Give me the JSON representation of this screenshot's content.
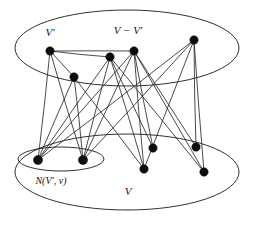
{
  "figure": {
    "background_color": "#ffffff",
    "stroke_color": "#1a1a1a",
    "node_color": "#0d0d0d",
    "width": 253,
    "height": 228
  },
  "labels": [
    {
      "id": "v-prime",
      "text": "V′",
      "x": 50,
      "y": 33,
      "size": "normal"
    },
    {
      "id": "v-minus-vprime",
      "text": "V − V′",
      "x": 128,
      "y": 31,
      "size": "normal"
    },
    {
      "id": "neighborhood",
      "text": "N(V′, v)",
      "x": 51,
      "y": 182,
      "size": "small"
    },
    {
      "id": "vertex-set-v",
      "text": "V",
      "x": 128,
      "y": 192,
      "size": "normal"
    }
  ],
  "regions": [
    {
      "id": "top-ellipse",
      "name": "upper-vertex-region",
      "cx": 127,
      "cy": 48,
      "rx": 112,
      "ry": 38
    },
    {
      "id": "bottom-ellipse",
      "name": "lower-vertex-region",
      "cx": 127,
      "cy": 172,
      "rx": 112,
      "ry": 38
    },
    {
      "id": "inner-ellipse",
      "name": "neighborhood-subregion",
      "cx": 61,
      "cy": 159,
      "rx": 43,
      "ry": 12
    }
  ],
  "nodes": [
    {
      "id": "t1",
      "group": "top",
      "x": 50,
      "y": 51,
      "r": 4.2
    },
    {
      "id": "t2",
      "group": "top",
      "x": 74,
      "y": 77,
      "r": 4.2
    },
    {
      "id": "t3",
      "group": "top",
      "x": 110,
      "y": 57,
      "r": 4.2
    },
    {
      "id": "t4",
      "group": "top",
      "x": 134,
      "y": 51,
      "r": 4.2
    },
    {
      "id": "t5",
      "group": "top",
      "x": 194,
      "y": 40,
      "r": 4.2
    },
    {
      "id": "b1",
      "group": "inner",
      "x": 38,
      "y": 160,
      "r": 4.6
    },
    {
      "id": "b2",
      "group": "inner",
      "x": 83,
      "y": 160,
      "r": 4.6
    },
    {
      "id": "b3",
      "group": "bottom",
      "x": 153,
      "y": 148,
      "r": 4.2
    },
    {
      "id": "b4",
      "group": "bottom",
      "x": 144,
      "y": 169,
      "r": 4.2
    },
    {
      "id": "b5",
      "group": "bottom",
      "x": 196,
      "y": 147,
      "r": 4.2
    },
    {
      "id": "b6",
      "group": "bottom",
      "x": 204,
      "y": 172,
      "r": 4.2
    }
  ],
  "edges": [
    {
      "from": "t1",
      "to": "t4"
    },
    {
      "from": "t1",
      "to": "t3"
    },
    {
      "from": "t1",
      "to": "t2"
    },
    {
      "from": "t1",
      "to": "b1"
    },
    {
      "from": "t1",
      "to": "b2"
    },
    {
      "from": "t2",
      "to": "b1"
    },
    {
      "from": "t2",
      "to": "b2"
    },
    {
      "from": "t3",
      "to": "b1"
    },
    {
      "from": "t3",
      "to": "b2"
    },
    {
      "from": "t3",
      "to": "b3"
    },
    {
      "from": "t3",
      "to": "b4"
    },
    {
      "from": "t4",
      "to": "b1"
    },
    {
      "from": "t4",
      "to": "b2"
    },
    {
      "from": "t4",
      "to": "b4"
    },
    {
      "from": "t4",
      "to": "b5"
    },
    {
      "from": "t4",
      "to": "b6"
    },
    {
      "from": "t5",
      "to": "b1"
    },
    {
      "from": "t5",
      "to": "b2"
    },
    {
      "from": "t5",
      "to": "b5"
    },
    {
      "from": "t5",
      "to": "b6"
    },
    {
      "from": "t5",
      "to": "b4"
    },
    {
      "from": "t3",
      "to": "b6"
    },
    {
      "from": "t2",
      "to": "b4"
    },
    {
      "from": "t4",
      "to": "b3"
    }
  ]
}
